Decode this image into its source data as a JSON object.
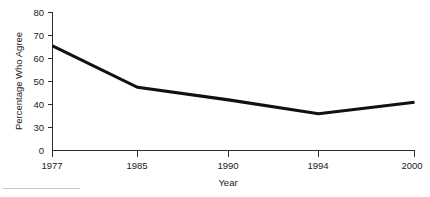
{
  "chart_data": {
    "type": "line",
    "title": "",
    "xlabel": "Year",
    "ylabel": "Percentage Who Agree",
    "x": [
      1977,
      1985,
      1990,
      1994,
      2000
    ],
    "xtick_labels": [
      "1977",
      "1985",
      "1990",
      "1994",
      "2000"
    ],
    "values": [
      65.5,
      47.5,
      42.0,
      36.0,
      41.0
    ],
    "ytick_labels": [
      "0",
      "30",
      "40",
      "50",
      "60",
      "70",
      "80"
    ],
    "ytick_values": [
      0,
      30,
      40,
      50,
      60,
      70,
      80
    ],
    "ylim": [
      0,
      80
    ],
    "axis_break": true,
    "grid": false,
    "legend": null,
    "series": [
      {
        "name": "Percentage Who Agree",
        "values": [
          65.5,
          47.5,
          42.0,
          36.0,
          41.0
        ],
        "color": "#111111"
      }
    ]
  },
  "axis": {
    "y_title": "Percentage Who Agree",
    "x_title": "Year",
    "line_color": "#2b2b2b",
    "text_color": "#1a1a1a"
  },
  "ticks": {
    "y": [
      {
        "label": "80",
        "value": 80
      },
      {
        "label": "70",
        "value": 70
      },
      {
        "label": "60",
        "value": 60
      },
      {
        "label": "50",
        "value": 50
      },
      {
        "label": "40",
        "value": 40
      },
      {
        "label": "30",
        "value": 30
      },
      {
        "label": "0",
        "value": 0
      }
    ],
    "x": [
      {
        "label": "1977",
        "value": 1977
      },
      {
        "label": "1985",
        "value": 1985
      },
      {
        "label": "1990",
        "value": 1990
      },
      {
        "label": "1994",
        "value": 1994
      },
      {
        "label": "2000",
        "value": 2000
      }
    ]
  },
  "footnote": {
    "rule_color": "#c9c9c9"
  }
}
